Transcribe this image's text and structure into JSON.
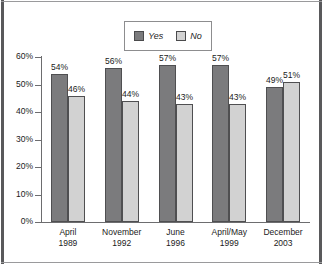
{
  "chart_data": {
    "type": "bar",
    "title": "",
    "subtitle": "",
    "xlabel": "",
    "ylabel": "",
    "ylim": [
      0,
      60
    ],
    "ytick_labels": [
      "0%",
      "10%",
      "20%",
      "30%",
      "40%",
      "50%",
      "60%"
    ],
    "ytick_values": [
      0,
      10,
      20,
      30,
      40,
      50,
      60
    ],
    "grid": false,
    "legend_position": "top-center",
    "categories": [
      {
        "line1": "April",
        "line2": "1989"
      },
      {
        "line1": "November",
        "line2": "1992"
      },
      {
        "line1": "June",
        "line2": "1996"
      },
      {
        "line1": "April/May",
        "line2": "1999"
      },
      {
        "line1": "December",
        "line2": "2003"
      }
    ],
    "series": [
      {
        "name": "Yes",
        "color": "#7b7b7d",
        "values": [
          54,
          56,
          57,
          57,
          49
        ],
        "labels": [
          "54%",
          "56%",
          "57%",
          "57%",
          "49%"
        ]
      },
      {
        "name": "No",
        "color": "#d2d2d2",
        "values": [
          46,
          44,
          43,
          43,
          51
        ],
        "labels": [
          "46%",
          "44%",
          "43%",
          "43%",
          "51%"
        ]
      }
    ]
  },
  "legend": {
    "entries": [
      {
        "label": "Yes",
        "swatch": "yes"
      },
      {
        "label": "No",
        "swatch": "no"
      }
    ]
  },
  "colors": {
    "yes_bar": "#7b7b7d",
    "no_bar": "#d2d2d2",
    "axis": "#6d6d6f",
    "frame": "#59595b",
    "text": "#1b1b1b"
  }
}
